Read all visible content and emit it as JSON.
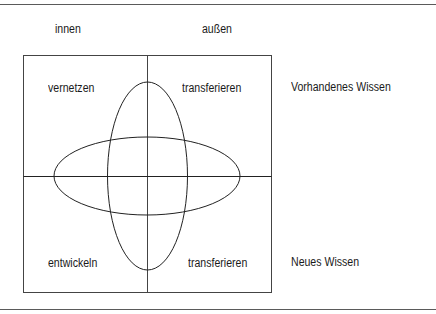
{
  "column_headers": {
    "inner": "innen",
    "outer": "außen"
  },
  "quadrants": {
    "top_left": "vernetzen",
    "top_right": "transferieren",
    "bottom_left": "entwickeln",
    "bottom_right": "transferieren"
  },
  "row_labels": {
    "top": "Vorhandenes Wissen",
    "bottom": "Neues Wissen"
  },
  "colors": {
    "line": "#1a1a1a",
    "text": "#1a1a1a",
    "background": "#ffffff"
  }
}
